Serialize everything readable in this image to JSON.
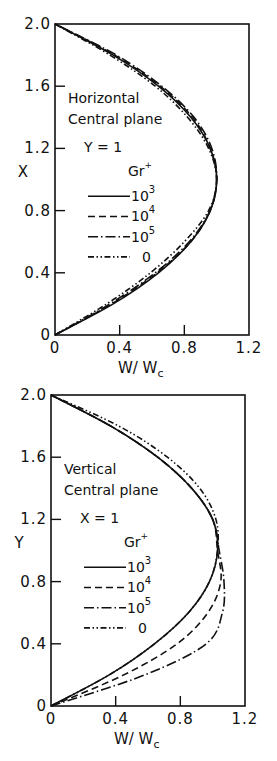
{
  "chart_data": [
    {
      "type": "line",
      "title": "Horizontal Central plane",
      "annotation_lines": [
        "Horizontal",
        "Central plane",
        "Y = 1"
      ],
      "xlabel": "W/Wc",
      "ylabel": "X",
      "xlim": [
        0,
        1.2
      ],
      "ylim": [
        0,
        2.0
      ],
      "xticks": [
        "0",
        "0.4",
        "0.8",
        "1.2"
      ],
      "yticks": [
        "0",
        "0.4",
        "0.8",
        "1.2",
        "1.6",
        "2.0"
      ],
      "grid": false,
      "legend": {
        "title": "Gr+",
        "position": "center-left",
        "entries": [
          "10^3",
          "10^4",
          "10^5",
          "0"
        ]
      },
      "series": [
        {
          "name": "10^3",
          "style": "solid",
          "x": [
            0,
            0.36,
            0.64,
            0.84,
            0.96,
            1.0,
            0.96,
            0.84,
            0.64,
            0.36,
            0
          ],
          "y": [
            0,
            0.2,
            0.4,
            0.6,
            0.8,
            1.0,
            1.2,
            1.4,
            1.6,
            1.8,
            2.0
          ]
        },
        {
          "name": "10^4",
          "style": "dashed",
          "x": [
            0,
            0.35,
            0.63,
            0.84,
            0.96,
            1.0,
            0.96,
            0.85,
            0.65,
            0.37,
            0
          ],
          "y": [
            0,
            0.2,
            0.4,
            0.6,
            0.8,
            1.0,
            1.2,
            1.4,
            1.6,
            1.8,
            2.0
          ]
        },
        {
          "name": "10^5",
          "style": "dash-dot",
          "x": [
            0,
            0.34,
            0.62,
            0.83,
            0.96,
            1.0,
            0.97,
            0.86,
            0.66,
            0.38,
            0
          ],
          "y": [
            0,
            0.2,
            0.4,
            0.6,
            0.8,
            1.0,
            1.2,
            1.4,
            1.6,
            1.8,
            2.0
          ]
        },
        {
          "name": "0",
          "style": "dash-dot-dot",
          "x": [
            0,
            0.32,
            0.59,
            0.8,
            0.95,
            1.0,
            0.95,
            0.82,
            0.62,
            0.34,
            0
          ],
          "y": [
            0,
            0.2,
            0.4,
            0.6,
            0.8,
            1.0,
            1.2,
            1.4,
            1.6,
            1.8,
            2.0
          ]
        }
      ]
    },
    {
      "type": "line",
      "title": "Vertical Central plane",
      "annotation_lines": [
        "Vertical",
        "Central plane",
        "X = 1"
      ],
      "xlabel": "W/Wc",
      "ylabel": "Y",
      "xlim": [
        0,
        1.2
      ],
      "ylim": [
        0,
        2.0
      ],
      "xticks": [
        "0",
        "0.4",
        "0.8",
        "1.2"
      ],
      "yticks": [
        "0",
        "0.4",
        "0.8",
        "1.2",
        "1.6",
        "2.0"
      ],
      "grid": false,
      "legend": {
        "title": "Gr+",
        "position": "center-left",
        "entries": [
          "10^3",
          "10^4",
          "10^5",
          "0"
        ]
      },
      "series": [
        {
          "name": "10^3",
          "style": "solid",
          "x": [
            0,
            0.36,
            0.64,
            0.85,
            0.98,
            1.03,
            1.0,
            0.87,
            0.66,
            0.37,
            0
          ],
          "y": [
            0,
            0.2,
            0.4,
            0.6,
            0.8,
            1.0,
            1.2,
            1.4,
            1.6,
            1.8,
            2.0
          ]
        },
        {
          "name": "10^4",
          "style": "dashed",
          "x": [
            0,
            0.45,
            0.78,
            0.97,
            1.05,
            1.03,
            1.0,
            0.87,
            0.66,
            0.37,
            0
          ],
          "y": [
            0,
            0.2,
            0.4,
            0.6,
            0.8,
            1.0,
            1.2,
            1.4,
            1.6,
            1.8,
            2.0
          ]
        },
        {
          "name": "10^5",
          "style": "dash-dot",
          "x": [
            0,
            0.58,
            0.96,
            1.06,
            1.07,
            1.04,
            1.0,
            0.87,
            0.66,
            0.37,
            0
          ],
          "y": [
            0,
            0.2,
            0.4,
            0.6,
            0.8,
            1.0,
            1.2,
            1.4,
            1.6,
            1.8,
            2.0
          ]
        },
        {
          "name": "0",
          "style": "dash-dot-dot",
          "x": [
            0,
            0.36,
            0.64,
            0.85,
            0.98,
            1.03,
            1.02,
            0.92,
            0.72,
            0.42,
            0
          ],
          "y": [
            0,
            0.2,
            0.4,
            0.6,
            0.8,
            1.0,
            1.2,
            1.4,
            1.6,
            1.8,
            2.0
          ]
        }
      ]
    }
  ],
  "charts": {
    "top": {
      "frame": {
        "left": 55,
        "top": 24,
        "right": 249,
        "bottom": 335
      },
      "ylabel": "X",
      "xlabel_main": "W/ W",
      "xlabel_sub": "c",
      "annotation": [
        "Horizontal",
        "Central plane",
        "Y = 1"
      ],
      "legend_title": "Gr",
      "legend_title_sup": "+",
      "legend_entries": [
        {
          "base": "10",
          "exp": "3",
          "style": "solid"
        },
        {
          "base": "10",
          "exp": "4",
          "style": "dashed"
        },
        {
          "base": "10",
          "exp": "5",
          "style": "dash-dot"
        },
        {
          "base": "0",
          "exp": "",
          "style": "dash-dot-dot"
        }
      ]
    },
    "bottom": {
      "frame": {
        "left": 51,
        "top": 395,
        "right": 245,
        "bottom": 706
      },
      "ylabel": "Y",
      "xlabel_main": "W/ W",
      "xlabel_sub": "c",
      "annotation": [
        "Vertical",
        "Central plane",
        "X = 1"
      ],
      "legend_title": "Gr",
      "legend_title_sup": "+",
      "legend_entries": [
        {
          "base": "10",
          "exp": "3",
          "style": "solid"
        },
        {
          "base": "10",
          "exp": "4",
          "style": "dashed"
        },
        {
          "base": "10",
          "exp": "5",
          "style": "dash-dot"
        },
        {
          "base": "0",
          "exp": "",
          "style": "dash-dot-dot"
        }
      ]
    }
  }
}
